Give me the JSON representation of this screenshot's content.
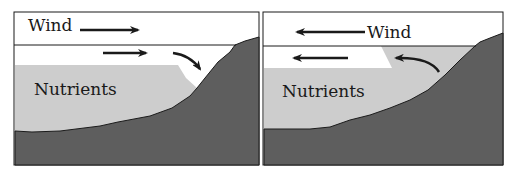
{
  "colors": {
    "background": "#ffffff",
    "nutrient_water": "#cdcdcd",
    "seafloor": "#5e5e5e",
    "line": "#1a1a1a"
  },
  "panels": [
    {
      "name": "downwelling",
      "wind_label": "Wind",
      "wind_direction": "right",
      "nutrients_label": "Nutrients"
    },
    {
      "name": "upwelling",
      "wind_label": "Wind",
      "wind_direction": "left",
      "nutrients_label": "Nutrients"
    }
  ]
}
